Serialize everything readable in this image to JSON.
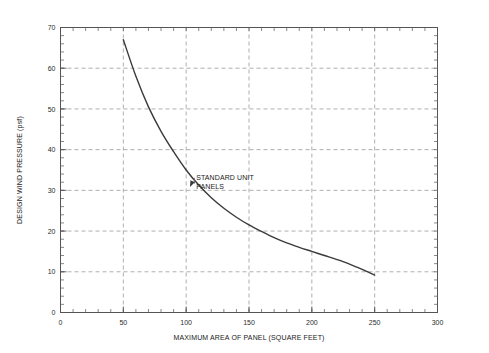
{
  "chart_data": {
    "type": "line",
    "title": "",
    "xlabel": "MAXIMUM AREA OF PANEL (SQUARE FEET)",
    "ylabel": "DESIGN WIND PRESSURE (psf)",
    "xlim": [
      0,
      300
    ],
    "ylim": [
      0,
      70
    ],
    "xticks": [
      0,
      50,
      100,
      150,
      200,
      250,
      300
    ],
    "yticks": [
      0,
      10,
      20,
      30,
      40,
      50,
      60,
      70
    ],
    "xtick_labels": [
      "0",
      "50",
      "100",
      "150",
      "200",
      "250",
      "300"
    ],
    "ytick_labels": [
      "0",
      "10",
      "20",
      "30",
      "40",
      "50",
      "60",
      "70"
    ],
    "x_minor_step": 10,
    "y_minor_step": 2,
    "grid": true,
    "grid_style": "dashed",
    "grid_color": "#9a9a9a",
    "legend": null,
    "series": [
      {
        "name": "STANDARD UNIT PANELS",
        "color": "#3a3a3a",
        "x": [
          50,
          60,
          70,
          80,
          90,
          100,
          110,
          120,
          130,
          140,
          150,
          160,
          170,
          180,
          190,
          200,
          210,
          220,
          230,
          240,
          250
        ],
        "values": [
          67.0,
          58.0,
          50.5,
          44.5,
          39.5,
          35.0,
          31.3,
          28.2,
          25.6,
          23.4,
          21.5,
          19.9,
          18.4,
          17.1,
          16.0,
          15.0,
          14.0,
          13.0,
          11.9,
          10.6,
          9.2
        ]
      }
    ],
    "annotations": [
      {
        "id": "standard-unit-panels",
        "lines": [
          "STANDARD UNIT",
          "PANELS"
        ],
        "text_x": 108,
        "text_y": 32.5,
        "point_x": 103,
        "point_y": 30.8,
        "arrow": true
      }
    ]
  },
  "axes": {
    "frame_color": "#555555",
    "tick_color": "#555555",
    "text_color": "#1a1a1a"
  }
}
